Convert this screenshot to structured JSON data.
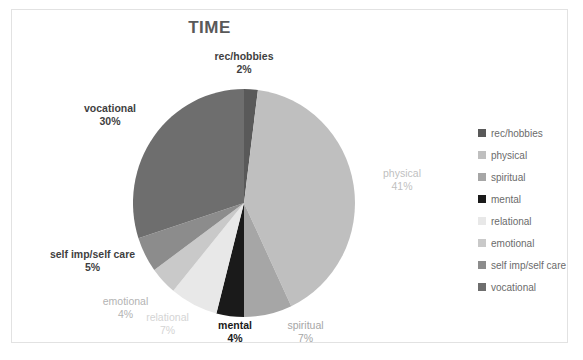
{
  "chart": {
    "title": "TIME"
  },
  "chart_data": {
    "type": "pie",
    "title": "TIME",
    "categories": [
      "rec/hobbies",
      "physical",
      "spiritual",
      "mental",
      "relational",
      "emotional",
      "self imp/self care",
      "vocational"
    ],
    "values": [
      2,
      41,
      7,
      4,
      7,
      4,
      5,
      30
    ],
    "value_labels": [
      "2%",
      "41%",
      "7%",
      "4%",
      "7%",
      "4%",
      "5%",
      "30%"
    ],
    "unit": "%",
    "start_angle": 0,
    "direction": "clockwise",
    "legend_position": "right",
    "colors": [
      "#595959",
      "#bfbfbf",
      "#a6a6a6",
      "#1a1a1a",
      "#e8e8e8",
      "#c9c9c9",
      "#8c8c8c",
      "#6e6e6e"
    ],
    "label_colors": [
      "#3f3f3f",
      "#bfbfbf",
      "#a6a6a6",
      "#1a1a1a",
      "#d4d4d4",
      "#b3b3b3",
      "#3f3f3f",
      "#3f3f3f"
    ]
  },
  "labels": {
    "rec": {
      "name": "rec/hobbies",
      "value": "2%"
    },
    "physical": {
      "name": "physical",
      "value": "41%"
    },
    "spiritual": {
      "name": "spiritual",
      "value": "7%"
    },
    "mental": {
      "name": "mental",
      "value": "4%"
    },
    "relational": {
      "name": "relational",
      "value": "7%"
    },
    "emotional": {
      "name": "emotional",
      "value": "4%"
    },
    "selfimp": {
      "name": "self imp/self care",
      "value": "5%"
    },
    "vocational": {
      "name": "vocational",
      "value": "30%"
    }
  },
  "legend": {
    "items": [
      {
        "label": "rec/hobbies",
        "color": "#595959"
      },
      {
        "label": "physical",
        "color": "#bfbfbf"
      },
      {
        "label": "spiritual",
        "color": "#a6a6a6"
      },
      {
        "label": "mental",
        "color": "#1a1a1a"
      },
      {
        "label": "relational",
        "color": "#e8e8e8"
      },
      {
        "label": "emotional",
        "color": "#c9c9c9"
      },
      {
        "label": "self imp/self care",
        "color": "#8c8c8c"
      },
      {
        "label": "vocational",
        "color": "#6e6e6e"
      }
    ]
  }
}
